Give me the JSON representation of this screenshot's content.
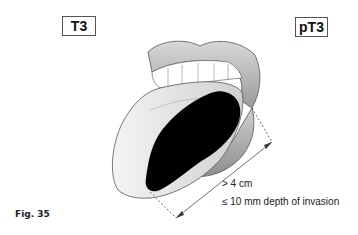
{
  "stages": {
    "clinical": "T3",
    "pathological": "pT3"
  },
  "annotations": {
    "size": "> 4 cm",
    "depth": "≤ 10 mm depth of invasion"
  },
  "figure": {
    "label": "Fig. 35"
  },
  "colors": {
    "tumor": "#000000",
    "lips": "#bdbdbd",
    "tongue": "#ededed",
    "outline": "#555555"
  }
}
